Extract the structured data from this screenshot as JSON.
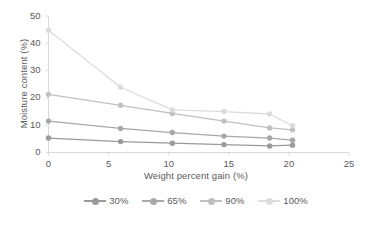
{
  "chart_data": {
    "type": "line",
    "title": "",
    "subtitle": "",
    "xlabel": "Weight percent gain (%)",
    "ylabel": "Moisture content (%)",
    "xlim": [
      0,
      25
    ],
    "ylim": [
      0,
      50
    ],
    "xticks": [
      0,
      5,
      10,
      15,
      20,
      25
    ],
    "yticks": [
      0,
      10,
      20,
      30,
      40,
      50
    ],
    "grid": false,
    "legend_position": "bottom",
    "markers": "circle",
    "x": [
      0,
      6.0,
      10.3,
      14.6,
      18.4,
      20.3
    ],
    "series": [
      {
        "name": "30%",
        "color": "#9a9a9a",
        "values": [
          5.3,
          4.0,
          3.4,
          2.9,
          2.4,
          2.7
        ]
      },
      {
        "name": "65%",
        "color": "#a8a8a8",
        "values": [
          11.5,
          8.8,
          7.3,
          6.0,
          5.3,
          4.5
        ]
      },
      {
        "name": "90%",
        "color": "#c0c0c0",
        "values": [
          21.3,
          17.3,
          14.3,
          11.5,
          9.0,
          8.3
        ]
      },
      {
        "name": "100%",
        "color": "#dcdcdc",
        "values": [
          44.8,
          23.9,
          15.6,
          15.0,
          14.1,
          9.8
        ]
      }
    ]
  },
  "axes": {
    "x_tick_labels": [
      "0",
      "5",
      "10",
      "15",
      "20",
      "25"
    ],
    "y_tick_labels": [
      "0",
      "10",
      "20",
      "30",
      "40",
      "50"
    ],
    "x_title": "Weight percent gain (%)",
    "y_title": "Moisture content (%)",
    "axis_color": "#d9d9d9"
  },
  "legend": {
    "items": [
      {
        "label": "30%",
        "color": "#9a9a9a"
      },
      {
        "label": "65%",
        "color": "#a8a8a8"
      },
      {
        "label": "90%",
        "color": "#c0c0c0"
      },
      {
        "label": "100%",
        "color": "#dcdcdc"
      }
    ]
  }
}
